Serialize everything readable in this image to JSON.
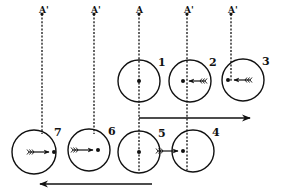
{
  "figure": {
    "background": "#ffffff",
    "ink": "#111111"
  },
  "markers": [
    {
      "id": "m1",
      "label": "A'",
      "x": 42,
      "top": 14,
      "bottom": 134
    },
    {
      "id": "m2",
      "label": "A'",
      "x": 94,
      "top": 14,
      "bottom": 134
    },
    {
      "id": "m3",
      "label": "A",
      "x": 139,
      "top": 14,
      "bottom": 172
    },
    {
      "id": "m4",
      "label": "A'",
      "x": 187,
      "top": 14,
      "bottom": 170
    },
    {
      "id": "m5",
      "label": "A'",
      "x": 231,
      "top": 14,
      "bottom": 82
    }
  ],
  "circles": [
    {
      "id": "c1",
      "number": "1",
      "cx": 139,
      "cy": 81,
      "r": 21,
      "dot_x": 139,
      "arrow": "none"
    },
    {
      "id": "c2",
      "number": "2",
      "cx": 190,
      "cy": 81,
      "r": 21,
      "dot_x": 183,
      "arrow": "left"
    },
    {
      "id": "c3",
      "number": "3",
      "cx": 243,
      "cy": 80,
      "r": 21,
      "dot_x": 228,
      "arrow": "left"
    },
    {
      "id": "c4",
      "number": "4",
      "cx": 193,
      "cy": 151,
      "r": 21,
      "dot_x": 183,
      "arrow": "right"
    },
    {
      "id": "c5",
      "number": "5",
      "cx": 139,
      "cy": 152,
      "r": 21,
      "dot_x": 139,
      "arrow": "none"
    },
    {
      "id": "c6",
      "number": "6",
      "cx": 89,
      "cy": 150,
      "r": 21,
      "dot_x": 98,
      "arrow": "right"
    },
    {
      "id": "c7",
      "number": "7",
      "cx": 34,
      "cy": 152,
      "r": 22,
      "dot_x": 54,
      "arrow": "right"
    }
  ],
  "motion_arrows": [
    {
      "id": "upper-motion-arrow",
      "direction": "right",
      "x1": 139,
      "x2": 250,
      "y": 118
    },
    {
      "id": "lower-motion-arrow",
      "direction": "left",
      "x1": 40,
      "x2": 152,
      "y": 184
    }
  ]
}
